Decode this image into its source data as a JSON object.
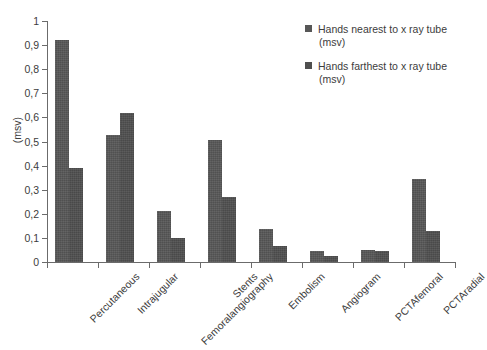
{
  "chart_data": {
    "type": "bar",
    "title": "",
    "subtitle": "",
    "xlabel": "",
    "ylabel": "(msv)",
    "ylim": [
      0,
      1
    ],
    "ytick_labels": [
      "0",
      "0,1",
      "0,2",
      "0,3",
      "0,4",
      "0,5",
      "0,6",
      "0,7",
      "0,8",
      "0,9",
      "1"
    ],
    "ytick_values": [
      0,
      0.1,
      0.2,
      0.3,
      0.4,
      0.5,
      0.6,
      0.7,
      0.8,
      0.9,
      1
    ],
    "grid": false,
    "legend_position": "top-right",
    "categories": [
      "Percutaneous",
      "Intrajugular",
      "Femoralangiography",
      "Stents",
      "Embolism",
      "Angiogram",
      "PCTAfemoral",
      "PCTAradial"
    ],
    "series": [
      {
        "name": "Hands nearest to x ray tube (msv)",
        "legend_line_1": "Hands nearest to x ray tube",
        "legend_line_2": "(msv)",
        "color": "#575757",
        "values": [
          0.92,
          0.525,
          0.21,
          0.505,
          0.135,
          0.045,
          0.05,
          0.345
        ]
      },
      {
        "name": "Hands farthest to x ray tube (msv)",
        "legend_line_1": "Hands farthest to x ray tube",
        "legend_line_2": "(msv)",
        "color": "#4f4f4f",
        "values": [
          0.39,
          0.62,
          0.1,
          0.27,
          0.065,
          0.025,
          0.045,
          0.13
        ]
      }
    ]
  }
}
